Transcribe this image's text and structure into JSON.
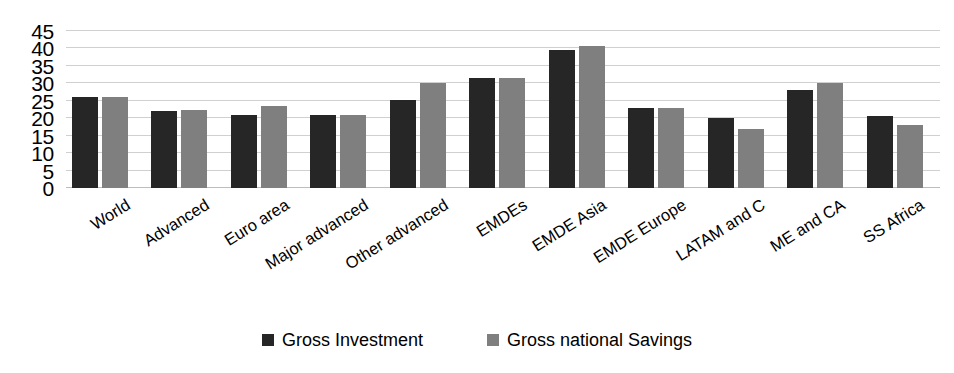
{
  "chart_data": {
    "type": "bar",
    "title": "",
    "subtitle": "",
    "xlabel": "",
    "ylabel": "",
    "ylim": [
      0,
      45
    ],
    "yticks": [
      0,
      5,
      10,
      15,
      20,
      25,
      30,
      35,
      40,
      45
    ],
    "grid": true,
    "grid_axis": "y",
    "legend_position": "bottom",
    "orientation": "vertical",
    "xtick_rotation": -32,
    "categories": [
      "World",
      "Advanced",
      "Euro area",
      "Major advanced",
      "Other advanced",
      "EMDEs",
      "EMDE Asia",
      "EMDE Europe",
      "LATAM and C",
      "ME and CA",
      "SS Africa"
    ],
    "series": [
      {
        "name": "Gross Investment",
        "color": "#262626",
        "values": [
          26.0,
          22.0,
          21.0,
          21.0,
          25.3,
          31.5,
          39.5,
          23.0,
          20.0,
          28.0,
          20.5
        ]
      },
      {
        "name": "Gross national Savings",
        "color": "#7f7f7f",
        "values": [
          26.2,
          22.3,
          23.5,
          20.8,
          30.0,
          31.5,
          40.8,
          22.8,
          17.0,
          30.0,
          18.0
        ]
      }
    ]
  },
  "legend": {
    "items": [
      {
        "label": "Gross Investment",
        "color": "#262626"
      },
      {
        "label": "Gross national Savings",
        "color": "#7f7f7f"
      }
    ]
  },
  "axes": {
    "y": {
      "ticks": [
        "45",
        "40",
        "35",
        "30",
        "25",
        "20",
        "15",
        "10",
        "5",
        "0"
      ]
    }
  },
  "colors": {
    "series_dark": "#262626",
    "series_gray": "#7f7f7f",
    "gridline": "#d0d0d0",
    "background": "#ffffff",
    "text": "#000000"
  }
}
